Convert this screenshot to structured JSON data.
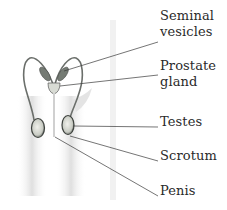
{
  "diagram": {
    "labels": [
      {
        "id": "seminal-vesicles",
        "lines": [
          "Seminal",
          "vesicles"
        ],
        "top": 8
      },
      {
        "id": "prostate-gland",
        "lines": [
          "Prostate",
          "gland"
        ],
        "top": 58
      },
      {
        "id": "testes",
        "lines": [
          "Testes"
        ],
        "top": 114
      },
      {
        "id": "scrotum",
        "lines": [
          "Scrotum"
        ],
        "top": 148
      },
      {
        "id": "penis",
        "lines": [
          "Penis"
        ],
        "top": 183
      }
    ],
    "leader_lines": [
      {
        "to": "seminal-vesicles",
        "x1": 64,
        "y1": 71,
        "x2": 158,
        "y2": 42
      },
      {
        "to": "prostate-gland",
        "x1": 60,
        "y1": 86,
        "x2": 158,
        "y2": 75
      },
      {
        "to": "testes",
        "x1": 73,
        "y1": 126,
        "x2": 158,
        "y2": 127
      },
      {
        "to": "scrotum",
        "x1": 70,
        "y1": 136,
        "x2": 158,
        "y2": 161
      },
      {
        "to": "penis",
        "x1": 55,
        "y1": 137,
        "x2": 158,
        "y2": 196
      }
    ],
    "colors": {
      "line": "#3a3a3a",
      "text": "#2a2a2a",
      "organ_fill": "#6e756e",
      "silhouette": "#e6e6e6"
    }
  }
}
